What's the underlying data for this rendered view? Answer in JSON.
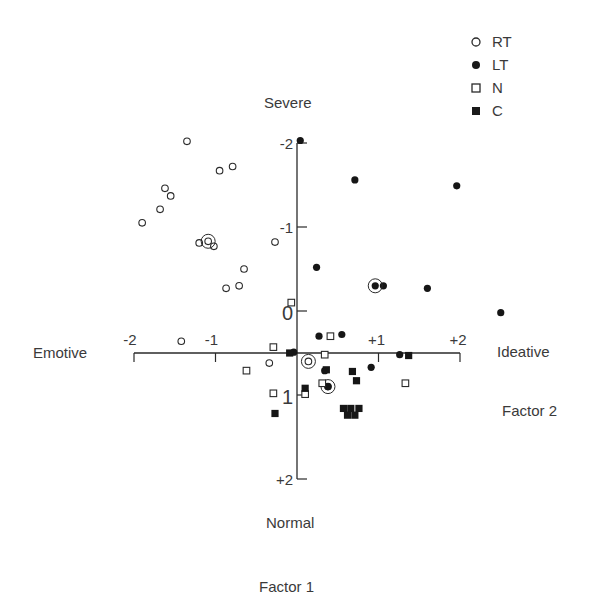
{
  "chart_data": {
    "type": "scatter",
    "title": "",
    "xlabel": "Factor 1",
    "ylabel": "Factor 2",
    "axis_end_labels": {
      "top": "Severe",
      "bottom": "Normal",
      "left": "Emotive",
      "right": "Ideative"
    },
    "x_ticks": [
      "-2",
      "-1",
      "+1",
      "+2"
    ],
    "x_tick_values": [
      -2,
      -1,
      1,
      2
    ],
    "y_ticks": [
      "-2",
      "-1",
      "0",
      "1",
      "+2"
    ],
    "y_tick_values": [
      -2,
      -1,
      0,
      1,
      2
    ],
    "xlim": [
      -2,
      2
    ],
    "ylim": [
      -2,
      2
    ],
    "y_inverted": true,
    "x_axis_crosses_y_at": 0.5,
    "grid": false,
    "legend_position": "top-right",
    "series": [
      {
        "name": "RT",
        "marker": "open-circle",
        "points": [
          [
            -1.35,
            -2.02
          ],
          [
            -1.62,
            -1.46
          ],
          [
            -1.55,
            -1.37
          ],
          [
            -1.68,
            -1.21
          ],
          [
            -1.9,
            -1.05
          ],
          [
            -0.95,
            -1.67
          ],
          [
            -0.79,
            -1.72
          ],
          [
            -1.09,
            -0.83
          ],
          [
            -1.02,
            -0.77
          ],
          [
            -1.2,
            -0.81
          ],
          [
            -0.27,
            -0.82
          ],
          [
            -0.65,
            -0.5
          ],
          [
            -0.71,
            -0.3
          ],
          [
            -0.87,
            -0.27
          ],
          [
            -1.42,
            0.36
          ],
          [
            -0.34,
            0.62
          ],
          [
            0.14,
            0.6
          ],
          [
            0.38,
            0.9
          ]
        ],
        "circled": [
          [
            -1.09,
            -0.83
          ],
          [
            0.14,
            0.6
          ],
          [
            0.38,
            0.9
          ]
        ]
      },
      {
        "name": "LT",
        "marker": "filled-circle",
        "points": [
          [
            0.04,
            -2.03
          ],
          [
            0.71,
            -1.56
          ],
          [
            1.96,
            -1.49
          ],
          [
            0.24,
            -0.52
          ],
          [
            0.96,
            -0.3
          ],
          [
            1.06,
            -0.3
          ],
          [
            1.6,
            -0.27
          ],
          [
            2.5,
            0.02
          ],
          [
            0.27,
            0.3
          ],
          [
            0.55,
            0.28
          ],
          [
            -0.04,
            0.49
          ],
          [
            0.34,
            0.71
          ],
          [
            0.91,
            0.67
          ],
          [
            1.26,
            0.52
          ],
          [
            0.38,
            0.9
          ]
        ],
        "circled": [
          [
            0.96,
            -0.3
          ]
        ]
      },
      {
        "name": "N",
        "marker": "open-square",
        "points": [
          [
            -0.07,
            -0.1
          ],
          [
            0.41,
            0.3
          ],
          [
            -0.29,
            0.43
          ],
          [
            -0.62,
            0.71
          ],
          [
            0.34,
            0.52
          ],
          [
            0.31,
            0.86
          ],
          [
            -0.29,
            0.98
          ],
          [
            0.1,
            0.99
          ],
          [
            1.33,
            0.86
          ]
        ]
      },
      {
        "name": "C",
        "marker": "filled-square",
        "points": [
          [
            -0.09,
            0.5
          ],
          [
            0.36,
            0.7
          ],
          [
            0.68,
            0.72
          ],
          [
            0.73,
            0.83
          ],
          [
            1.37,
            0.53
          ],
          [
            0.1,
            0.92
          ],
          [
            -0.27,
            1.22
          ],
          [
            0.57,
            1.16
          ],
          [
            0.66,
            1.16
          ],
          [
            0.76,
            1.16
          ],
          [
            0.62,
            1.24
          ],
          [
            0.71,
            1.24
          ]
        ]
      }
    ]
  },
  "labels": {
    "severe": "Severe",
    "normal": "Normal",
    "emotive": "Emotive",
    "ideative": "Ideative",
    "factor1": "Factor  1",
    "factor2": "Factor  2"
  },
  "legend": [
    {
      "label": "RT",
      "marker": "open-circle"
    },
    {
      "label": "LT",
      "marker": "filled-circle"
    },
    {
      "label": "N",
      "marker": "open-square"
    },
    {
      "label": "C",
      "marker": "filled-square"
    }
  ],
  "colors": {
    "ink": "#2a2a2a",
    "text": "#3a3a3a",
    "background": "#ffffff"
  }
}
